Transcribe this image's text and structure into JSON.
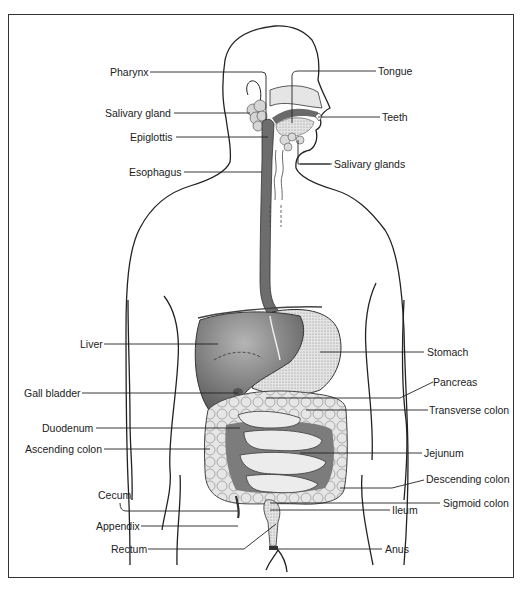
{
  "diagram": {
    "colors": {
      "organ_dark": "#6e6e6e",
      "organ_mid": "#9a9a9a",
      "organ_light": "#d9d9d9",
      "line": "#222222",
      "background": "#ffffff"
    },
    "labels_left": [
      {
        "id": "pharynx",
        "text": "Pharynx"
      },
      {
        "id": "salivary-gland",
        "text": "Salivary gland"
      },
      {
        "id": "epiglottis",
        "text": "Epiglottis"
      },
      {
        "id": "esophagus",
        "text": "Esophagus"
      },
      {
        "id": "liver",
        "text": "Liver"
      },
      {
        "id": "gall-bladder",
        "text": "Gall bladder"
      },
      {
        "id": "duodenum",
        "text": "Duodenum"
      },
      {
        "id": "ascending-colon",
        "text": "Ascending colon"
      },
      {
        "id": "cecum",
        "text": "Cecum"
      },
      {
        "id": "appendix",
        "text": "Appendix"
      },
      {
        "id": "rectum",
        "text": "Rectum"
      }
    ],
    "labels_right": [
      {
        "id": "tongue",
        "text": "Tongue"
      },
      {
        "id": "teeth",
        "text": "Teeth"
      },
      {
        "id": "salivary-glands",
        "text": "Salivary glands"
      },
      {
        "id": "stomach",
        "text": "Stomach"
      },
      {
        "id": "pancreas",
        "text": "Pancreas"
      },
      {
        "id": "transverse-colon",
        "text": "Transverse colon"
      },
      {
        "id": "jejunum",
        "text": "Jejunum"
      },
      {
        "id": "descending-colon",
        "text": "Descending colon"
      },
      {
        "id": "sigmoid-colon",
        "text": "Sigmoid colon"
      },
      {
        "id": "ileum",
        "text": "Ileum"
      },
      {
        "id": "anus",
        "text": "Anus"
      }
    ]
  }
}
